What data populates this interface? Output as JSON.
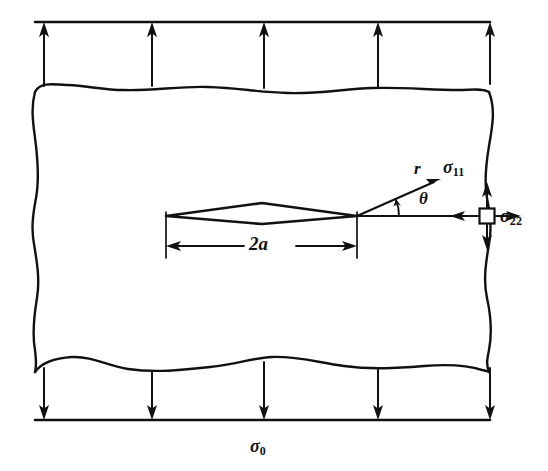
{
  "figure": {
    "kind": "fracture-mechanics-diagram",
    "background_color": "#ffffff",
    "line_color": "#111111"
  },
  "labels": {
    "remote_stress": {
      "symbol": "σ",
      "subscript": "0",
      "text": "σ0"
    },
    "stress_11": {
      "symbol": "σ",
      "subscript": "11",
      "text": "σ11"
    },
    "stress_22": {
      "symbol": "σ",
      "subscript": "22",
      "text": "σ22"
    },
    "radius": "r",
    "angle": "θ",
    "crack_length": "2a"
  },
  "geometry": {
    "plate": {
      "left_edge_x": 35,
      "right_edge_x": 490,
      "top_boundary_y": 85,
      "bottom_boundary_y": 368,
      "edge_style": "wavy-broken-away"
    },
    "top_load": {
      "bar_y": 22,
      "bar_x_start": 35,
      "bar_x_end": 490,
      "arrow_direction": "up",
      "arrow_count": 5,
      "arrow_x_positions": [
        44,
        152,
        264,
        378,
        490
      ]
    },
    "bottom_load": {
      "bar_y": 420,
      "bar_x_start": 35,
      "bar_x_end": 490,
      "arrow_direction": "down",
      "arrow_count": 5,
      "arrow_x_positions": [
        44,
        152,
        264,
        378,
        490
      ]
    },
    "crack": {
      "shape": "lens-rhombus",
      "left_tip": [
        166,
        216
      ],
      "right_tip": [
        357,
        216
      ],
      "top_vertex": [
        262,
        203
      ],
      "bottom_vertex": [
        262,
        224
      ]
    },
    "dimension_line": {
      "y": 246,
      "x_start": 166,
      "x_end": 357,
      "extension_top_y": 212,
      "extension_bottom_y": 258,
      "arrow_ends": "both"
    },
    "crack_tip_field": {
      "origin": [
        357,
        216
      ],
      "ray_end": [
        440,
        178
      ],
      "ray_angle_degrees": 22,
      "reference_axis_end": [
        465,
        216
      ],
      "arc_radius": 42
    },
    "stress_element": {
      "center": [
        487,
        216
      ],
      "size": 15,
      "arrows": [
        "up",
        "down",
        "left",
        "right"
      ]
    }
  },
  "chart_data": {
    "type": "diagram",
    "annotations": [
      "σ0",
      "σ11",
      "σ22",
      "r",
      "θ",
      "2a"
    ]
  }
}
